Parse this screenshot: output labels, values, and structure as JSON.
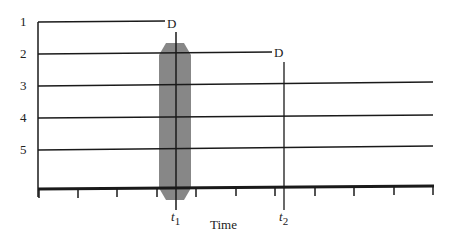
{
  "diagram": {
    "type": "timeline",
    "x_axis_label": "Time",
    "rows": [
      {
        "label": "1",
        "y": 22,
        "x_end": 165,
        "end_marker": "D"
      },
      {
        "label": "2",
        "y": 54,
        "x_end": 272,
        "end_marker": "D"
      },
      {
        "label": "3",
        "y": 86,
        "x_end": 433,
        "end_marker": ""
      },
      {
        "label": "4",
        "y": 118,
        "x_end": 433,
        "end_marker": ""
      },
      {
        "label": "5",
        "y": 150,
        "x_end": 433,
        "end_marker": ""
      }
    ],
    "time_markers": [
      {
        "label": "t",
        "subscript": "1",
        "x": 176
      },
      {
        "label": "t",
        "subscript": "2",
        "x": 284
      }
    ],
    "highlight_band": {
      "x": 159,
      "width": 32,
      "y_top": 43,
      "y_bottom": 200,
      "color": "#7a7a7a"
    },
    "axis": {
      "y": 188,
      "x_start": 38,
      "x_end": 434,
      "ticks": [
        39,
        78,
        117,
        157,
        196,
        236,
        275,
        315,
        354,
        394,
        433
      ]
    },
    "colors": {
      "line": "#1a1a1a",
      "band": "#7a7a7a"
    }
  }
}
